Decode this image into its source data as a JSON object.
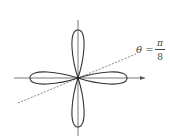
{
  "figure": {
    "type": "polar rose curve, four petals",
    "ray_label": {
      "lhs": "θ =",
      "numerator": "π",
      "denominator": "8"
    },
    "colors": {
      "curve": "#333333",
      "axes": "#555555",
      "ray": "#666666"
    }
  }
}
